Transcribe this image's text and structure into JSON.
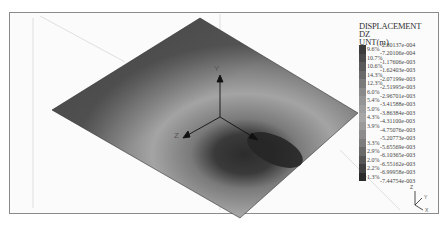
{
  "legend": {
    "title_line1": "DISPLACEMENT",
    "title_line2": "DZ",
    "unit": "UNT(m)",
    "values": [
      "-2.80137e-004",
      "-7.20106e-004",
      "-1.17606e-003",
      "-1.62403e-003",
      "-2.07199e-003",
      "-2.51995e-003",
      "-2.96701e-003",
      "-3.41588e-003",
      "-3.86384e-003",
      "-4.31100e-003",
      "-4.75076e-003",
      "-5.20773e-003",
      "-5.65569e-003",
      "-6.10365e-003",
      "-6.55162e-003",
      "-6.99958e-003",
      "-7.44754e-003"
    ],
    "percents": [
      "9.6%",
      "10.7%",
      "10.6%",
      "14.3%",
      "12.3%",
      "6.0%",
      "5.4%",
      "5.0%",
      "4.3%",
      "3.9%",
      "",
      "3.3%",
      "2.9%",
      "2.0%",
      "2.2%",
      "1.3%"
    ],
    "colors": [
      "#3c3c3c",
      "#4a4a4a",
      "#5a5a5a",
      "#6a6a6a",
      "#7a7a7a",
      "#8a8a8a",
      "#959595",
      "#9e9e9e",
      "#a6a6a6",
      "#9a9a9a",
      "#8c8c8c",
      "#7c7c7c",
      "#6a6a6a",
      "#555555",
      "#404040",
      "#2a2a2a"
    ]
  },
  "axes": {
    "y_label": "Y",
    "z_label": "Z",
    "x_label": "X"
  },
  "triad": {
    "z": "Z",
    "y": "Y",
    "x": "X"
  },
  "chart_data": {
    "type": "heatmap",
    "title": "DISPLACEMENT DZ",
    "unit": "m",
    "contour_levels": [
      -0.000280137,
      -0.000720106,
      -0.00117606,
      -0.00162403,
      -0.00207199,
      -0.00251995,
      -0.00296701,
      -0.00341588,
      -0.00386384,
      -0.004311,
      -0.00475076,
      -0.00520773,
      -0.00565569,
      -0.00610365,
      -0.00655162,
      -0.00699958,
      -0.00744754
    ],
    "band_percentages": [
      9.6,
      10.7,
      10.6,
      14.3,
      12.3,
      6.0,
      5.4,
      5.0,
      4.3,
      3.9,
      null,
      3.3,
      2.9,
      2.0,
      2.2,
      1.3
    ],
    "min": -0.00744754,
    "max": -0.000280137
  }
}
